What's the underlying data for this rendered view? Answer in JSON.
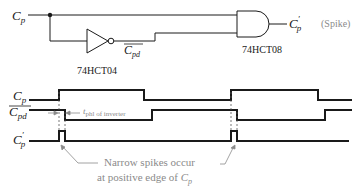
{
  "circuit": {
    "input_label": "C",
    "input_sub": "p",
    "inverter_part": "74HCT04",
    "and_part": "74HCT08",
    "inverted_delayed_label": "C",
    "inverted_delayed_sub": "pd",
    "output_label": "C",
    "output_prime": "′",
    "output_sub": "p",
    "output_note": "(Spike)"
  },
  "timing": {
    "signals": [
      {
        "label": "C",
        "sub": "p",
        "overbar": false,
        "prime": false
      },
      {
        "label": "C",
        "sub": "pd",
        "overbar": true,
        "prime": false
      },
      {
        "label": "C",
        "sub": "p",
        "overbar": false,
        "prime": true
      }
    ],
    "tpd_label_t": "t",
    "tpd_label_rest": "phl of inverter",
    "note_line1": "Narrow spikes occur",
    "note_line2": "at positive edge of",
    "note_sym": "C",
    "note_sub": "p"
  },
  "colors": {
    "line": "#1a1a1a",
    "annotation": "#8a8a8a"
  }
}
